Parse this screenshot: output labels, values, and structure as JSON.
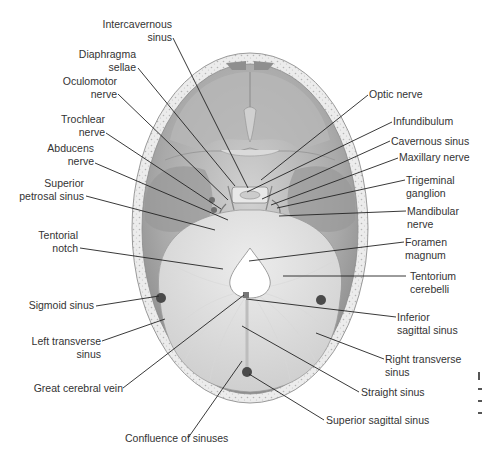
{
  "diagram": {
    "type": "anatomical-illustration",
    "colors": {
      "background": "#ffffff",
      "bone_outer": "#e6e6e6",
      "bone_dots": "#bdbdbd",
      "dura": "#a8a8a8",
      "dura_light": "#cfcfcf",
      "tentorium": "#dcdcdc",
      "leader_line": "#222222",
      "label_text": "#333333"
    }
  },
  "labels_left": [
    {
      "id": "intercavernous-sinus",
      "lines": [
        "Intercavernous",
        "sinus"
      ]
    },
    {
      "id": "diaphragma-sellae",
      "lines": [
        "Diaphragma",
        "sellae"
      ]
    },
    {
      "id": "oculomotor-nerve",
      "lines": [
        "Oculomotor",
        "nerve"
      ]
    },
    {
      "id": "trochlear-nerve",
      "lines": [
        "Trochlear",
        "nerve"
      ]
    },
    {
      "id": "abducens-nerve",
      "lines": [
        "Abducens",
        "nerve"
      ]
    },
    {
      "id": "superior-petrosal-sinus",
      "lines": [
        "Superior",
        "petrosal sinus"
      ]
    },
    {
      "id": "tentorial-notch",
      "lines": [
        "Tentorial",
        "notch"
      ]
    },
    {
      "id": "sigmoid-sinus",
      "lines": [
        "Sigmoid sinus"
      ]
    },
    {
      "id": "left-transverse-sinus",
      "lines": [
        "Left transverse",
        "sinus"
      ]
    },
    {
      "id": "great-cerebral-vein",
      "lines": [
        "Great cerebral vein"
      ]
    },
    {
      "id": "confluence-of-sinuses",
      "lines": [
        "Confluence of sinuses"
      ]
    }
  ],
  "labels_right": [
    {
      "id": "optic-nerve",
      "lines": [
        "Optic nerve"
      ]
    },
    {
      "id": "infundibulum",
      "lines": [
        "Infundibulum"
      ]
    },
    {
      "id": "cavernous-sinus",
      "lines": [
        "Cavernous sinus"
      ]
    },
    {
      "id": "maxillary-nerve",
      "lines": [
        "Maxillary nerve"
      ]
    },
    {
      "id": "trigeminal-ganglion",
      "lines": [
        "Trigeminal",
        "ganglion"
      ]
    },
    {
      "id": "mandibular-nerve",
      "lines": [
        "Mandibular",
        "nerve"
      ]
    },
    {
      "id": "foramen-magnum",
      "lines": [
        "Foramen",
        "magnum"
      ]
    },
    {
      "id": "tentorium-cerebelli",
      "lines": [
        "Tentorium",
        "cerebelli"
      ]
    },
    {
      "id": "inferior-sagittal-sinus",
      "lines": [
        "Inferior",
        "sagittal sinus"
      ]
    },
    {
      "id": "right-transverse-sinus",
      "lines": [
        "Right transverse",
        "sinus"
      ]
    },
    {
      "id": "straight-sinus",
      "lines": [
        "Straight sinus"
      ]
    },
    {
      "id": "superior-sagittal-sinus",
      "lines": [
        "Superior sagittal sinus"
      ]
    }
  ]
}
